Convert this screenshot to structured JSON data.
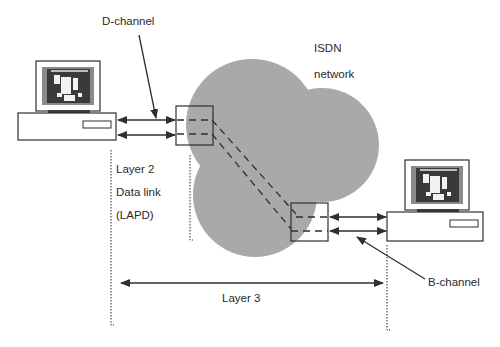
{
  "diagram": {
    "type": "ISDN network layer diagram",
    "network_label_line1": "ISDN",
    "network_label_line2": "network",
    "d_channel_label": "D-channel",
    "b_channel_label": "B-channel",
    "layer2_line1": "Layer 2",
    "layer2_line2": "Data link",
    "layer2_line3": "(LAPD)",
    "layer3_label": "Layer 3",
    "colors": {
      "cloud": "#a9a9a9",
      "line": "#2f2f2f",
      "screen_dark": "#3a3a3a",
      "screen_mid": "#8a8a8a",
      "background": "#ffffff"
    },
    "nodes": [
      {
        "id": "left-terminal",
        "kind": "computer"
      },
      {
        "id": "left-exchange",
        "kind": "switch-box"
      },
      {
        "id": "isdn-cloud",
        "kind": "network"
      },
      {
        "id": "right-exchange",
        "kind": "switch-box"
      },
      {
        "id": "right-terminal",
        "kind": "computer"
      }
    ],
    "links": [
      {
        "from": "left-terminal",
        "to": "left-exchange",
        "count": 2,
        "style": "double-arrow"
      },
      {
        "from": "left-exchange",
        "to": "right-exchange",
        "count": 2,
        "style": "dashed"
      },
      {
        "from": "right-exchange",
        "to": "right-terminal",
        "count": 2,
        "style": "double-arrow"
      }
    ]
  }
}
